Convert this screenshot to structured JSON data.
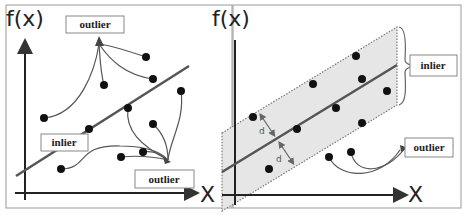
{
  "left_panel": {
    "y_axis_label": "f(x)",
    "x_axis_label": "X",
    "labels": {
      "outlier_top": "outlier",
      "inlier": "inlier",
      "outlier_bottom": "outlier"
    }
  },
  "right_panel": {
    "y_axis_label": "f(x)",
    "x_axis_label": "X",
    "distance_symbol": "d",
    "labels": {
      "inlier": "inlier",
      "outlier": "outlier",
      "ghost_text": "er"
    }
  },
  "colors": {
    "line": "#555555",
    "points": "#111111",
    "band_fill": "#e6e6e6",
    "band_border": "#777777",
    "label_border": "#888888"
  }
}
